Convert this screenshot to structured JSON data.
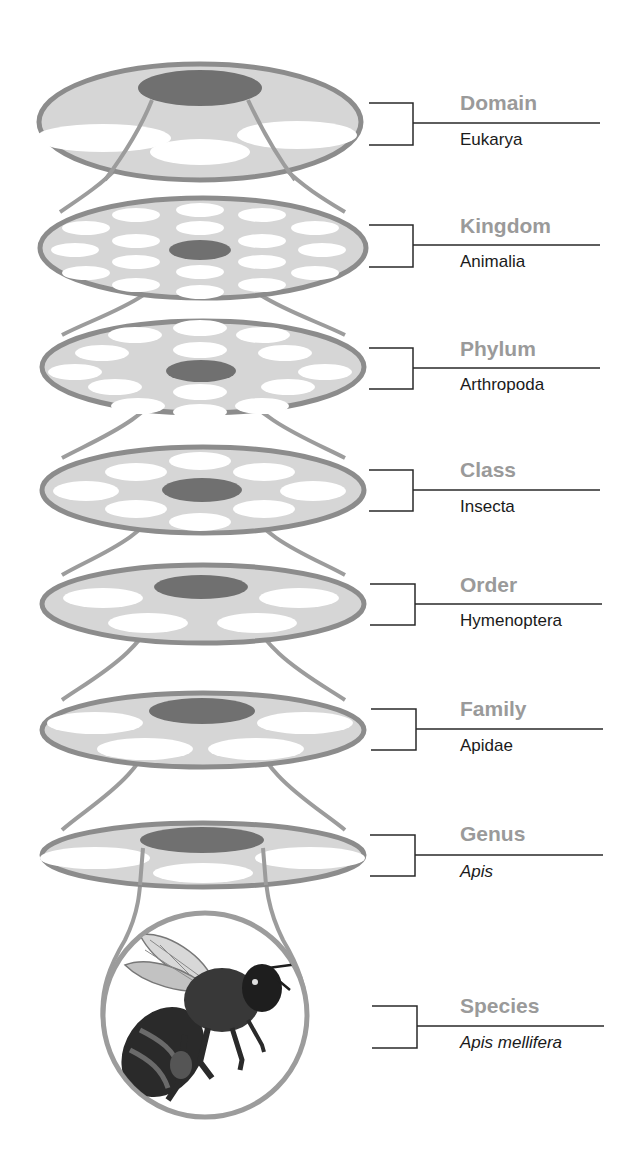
{
  "colors": {
    "rim": "#8c8c8c",
    "disk_fill": "#d6d6d6",
    "center": "#707070",
    "hole": "#ffffff",
    "rank_text": "#9a9a9a",
    "taxon_text": "#1a1a1a",
    "bracket": "#2a2a2a"
  },
  "levels": [
    {
      "rank": "Domain",
      "taxon": "Eukarya",
      "italic": false,
      "bracket": {
        "top": 103,
        "mid": 123,
        "bottom": 145
      }
    },
    {
      "rank": "Kingdom",
      "taxon": "Animalia",
      "italic": false,
      "bracket": {
        "top": 225,
        "mid": 245,
        "bottom": 267
      }
    },
    {
      "rank": "Phylum",
      "taxon": "Arthropoda",
      "italic": false,
      "bracket": {
        "top": 348,
        "mid": 368,
        "bottom": 389
      }
    },
    {
      "rank": "Class",
      "taxon": "Insecta",
      "italic": false,
      "bracket": {
        "top": 470,
        "mid": 490,
        "bottom": 511
      }
    },
    {
      "rank": "Order",
      "taxon": "Hymenoptera",
      "italic": false,
      "bracket": {
        "top": 584,
        "mid": 604,
        "bottom": 625
      }
    },
    {
      "rank": "Family",
      "taxon": "Apidae",
      "italic": false,
      "bracket": {
        "top": 709,
        "mid": 729,
        "bottom": 750
      }
    },
    {
      "rank": "Genus",
      "taxon": "Apis",
      "italic": true,
      "bracket": {
        "top": 835,
        "mid": 855,
        "bottom": 876
      }
    },
    {
      "rank": "Species",
      "taxon": "Apis mellifera",
      "italic": true,
      "bracket": {
        "top": 1006,
        "mid": 1026,
        "bottom": 1048
      }
    }
  ],
  "species_image": "honey-bee-illustration"
}
